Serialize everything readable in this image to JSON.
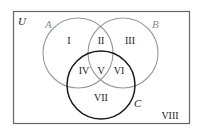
{
  "diagram": {
    "type": "venn-3-set",
    "universe_label": "U",
    "sets": [
      {
        "name": "A",
        "color": "#999999"
      },
      {
        "name": "B",
        "color": "#999999"
      },
      {
        "name": "C",
        "color": "#222222"
      }
    ],
    "regions": [
      {
        "label": "I",
        "description": "A only"
      },
      {
        "label": "II",
        "description": "A and B, not C"
      },
      {
        "label": "III",
        "description": "B only"
      },
      {
        "label": "IV",
        "description": "A and C, not B"
      },
      {
        "label": "V",
        "description": "A and B and C"
      },
      {
        "label": "VI",
        "description": "B and C, not A"
      },
      {
        "label": "VII",
        "description": "C only"
      },
      {
        "label": "VIII",
        "description": "outside A, B, C"
      }
    ],
    "colors": {
      "frame": "#555555",
      "circle_ab": "#999999",
      "circle_c": "#222222",
      "text": "#222222"
    }
  }
}
